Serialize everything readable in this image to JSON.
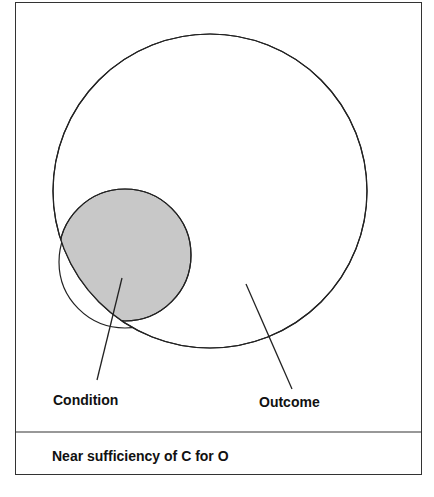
{
  "diagram": {
    "type": "venn-sufficiency",
    "sets": [
      {
        "name": "Condition",
        "label": "Condition",
        "fill": "#c8c8c8"
      },
      {
        "name": "Outcome",
        "label": "Outcome",
        "fill": "#ffffff"
      }
    ],
    "caption": "Near sufficiency of C for O",
    "colors": {
      "stroke": "#222222",
      "condition_fill": "#c8c8c8",
      "background": "#ffffff"
    }
  }
}
